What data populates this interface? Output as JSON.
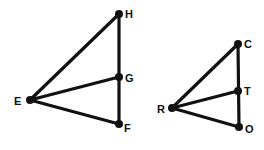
{
  "figures": [
    {
      "name": "triangle-EHF",
      "points": {
        "H": {
          "x": 119,
          "y": 14,
          "label": "H",
          "lx": 125,
          "ly": 18
        },
        "G": {
          "x": 119,
          "y": 77,
          "label": "G",
          "lx": 125,
          "ly": 82
        },
        "E": {
          "x": 30,
          "y": 100,
          "label": "E",
          "lx": 14,
          "ly": 105
        },
        "F": {
          "x": 119,
          "y": 124,
          "label": "F",
          "lx": 124,
          "ly": 132
        }
      },
      "segments": [
        [
          "E",
          "H"
        ],
        [
          "H",
          "F"
        ],
        [
          "E",
          "F"
        ],
        [
          "E",
          "G"
        ]
      ]
    },
    {
      "name": "triangle-RCO",
      "points": {
        "C": {
          "x": 238,
          "y": 44,
          "label": "C",
          "lx": 244,
          "ly": 48
        },
        "T": {
          "x": 238,
          "y": 91,
          "label": "T",
          "lx": 244,
          "ly": 95
        },
        "R": {
          "x": 172,
          "y": 108,
          "label": "R",
          "lx": 157,
          "ly": 113
        },
        "O": {
          "x": 239,
          "y": 127,
          "label": "O",
          "lx": 245,
          "ly": 133
        }
      },
      "segments": [
        [
          "R",
          "C"
        ],
        [
          "C",
          "O"
        ],
        [
          "R",
          "O"
        ],
        [
          "R",
          "T"
        ]
      ]
    }
  ]
}
